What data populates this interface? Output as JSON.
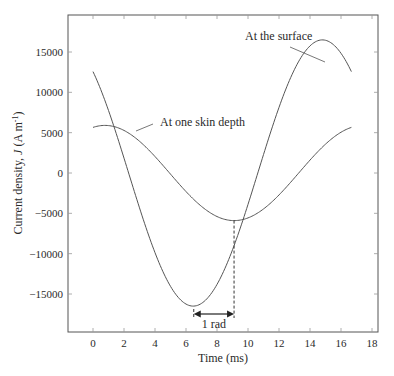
{
  "chart_data": {
    "type": "line",
    "title": "",
    "xlabel": "Time (ms)",
    "ylabel": "Current density, J (A m⁻¹)",
    "ylabel_parts": {
      "prefix": "Current density, ",
      "symbol": "J",
      "unit_open": " (A m",
      "sup": "-1",
      "unit_close": ")"
    },
    "xlim": [
      -1.6,
      18.4
    ],
    "ylim": [
      -19500,
      19700
    ],
    "xticks": [
      0,
      2,
      4,
      6,
      8,
      10,
      12,
      14,
      16,
      18
    ],
    "xtick_labels": [
      "0",
      "2",
      "4",
      "6",
      "8",
      "10",
      "12",
      "14",
      "16",
      "18"
    ],
    "yticks": [
      15000,
      10000,
      5000,
      0,
      -5000,
      -10000,
      -15000
    ],
    "ytick_labels": [
      "15000",
      "10000",
      "5000",
      "0",
      "-5000",
      "-10000",
      "-15000"
    ],
    "grid": false,
    "legend": "none (inline annotations)",
    "series": [
      {
        "name": "At the surface",
        "model": "J = 16500·cos(2π(t − 14.8)/16.67)",
        "amplitude": 16500,
        "period_ms": 16.67,
        "peak_time_ms": 14.8,
        "t_range_ms": [
          0,
          16.67
        ],
        "x": [
          0,
          1,
          2,
          3,
          4,
          5,
          6,
          6.5,
          7,
          8,
          9,
          10,
          11,
          12,
          13,
          14,
          14.8,
          15,
          16,
          16.67
        ],
        "values": [
          12500,
          7100,
          700,
          -5900,
          -11600,
          -15300,
          -16500,
          -16500,
          -15900,
          -12900,
          -7700,
          -1400,
          5100,
          10900,
          14800,
          16300,
          16500,
          16450,
          14700,
          12500
        ]
      },
      {
        "name": "At one skin depth",
        "model": "J = 5900·cos(2π(t − 0.77)/16.67)",
        "amplitude": 5900,
        "period_ms": 16.67,
        "peak_time_ms": 0.77,
        "t_range_ms": [
          0,
          16.67
        ],
        "x": [
          0,
          1,
          2,
          3,
          4,
          5,
          6,
          7,
          8,
          9,
          9.1,
          10,
          11,
          12,
          13,
          14,
          15,
          16,
          16.67
        ],
        "values": [
          5650,
          5880,
          5450,
          4400,
          2800,
          900,
          -1100,
          -3000,
          -4600,
          -5700,
          -5900,
          -5700,
          -5000,
          -3700,
          -2000,
          100,
          2100,
          3900,
          5650
        ]
      }
    ],
    "annotations": [
      {
        "text": "At the surface",
        "points_to": "surface curve near t≈13 ms"
      },
      {
        "text": "At one skin depth",
        "points_to": "skin-depth curve near t≈3.3 ms"
      },
      {
        "text": "1 rad",
        "type": "double-arrow",
        "from_ms": 6.5,
        "to_ms": 9.1,
        "note": "phase lag between surface minimum and skin-depth minimum"
      }
    ]
  },
  "colors": {
    "line": "#555555",
    "axis": "#555555",
    "text": "#2a2a2a",
    "background": "#ffffff"
  }
}
